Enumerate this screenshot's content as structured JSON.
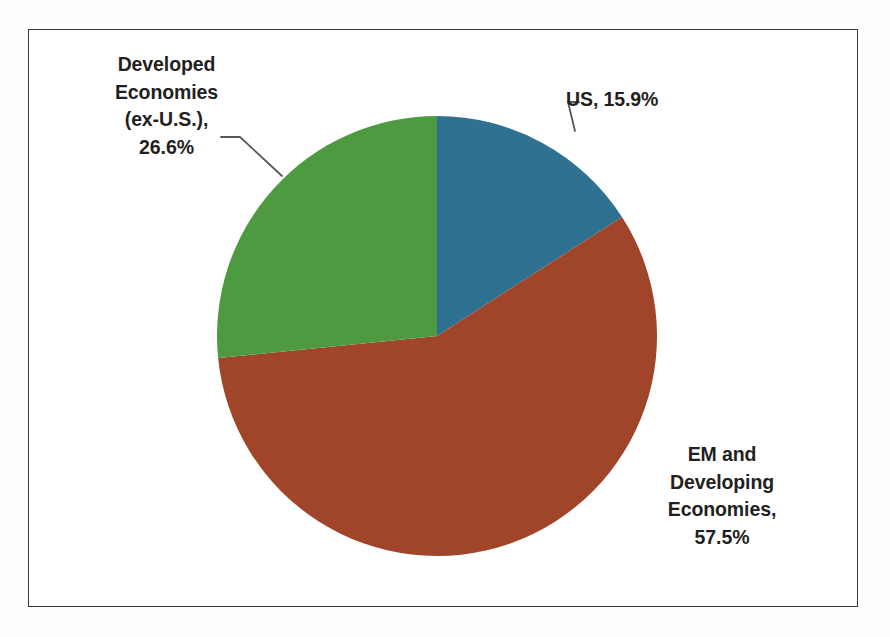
{
  "chart_data": {
    "type": "pie",
    "title": "",
    "subtitle": "",
    "xlabel": "",
    "ylabel": "",
    "legend_position": "none",
    "grid": false,
    "labels_inside": false,
    "start_angle_deg": 0,
    "direction": "clockwise",
    "categories": [
      "US",
      "EM and Developing Economies",
      "Developed Economies (ex-U.S.)"
    ],
    "values": [
      15.9,
      57.5,
      26.6
    ],
    "units": "percent",
    "total": 100.0,
    "colors": [
      "#2e7191",
      "#a0442a",
      "#4e9a41"
    ],
    "slices": [
      {
        "name": "US",
        "value": 15.9,
        "value_label": "15.9%",
        "color": "#2e7191",
        "start_angle_deg": 0.0,
        "end_angle_deg": 57.24,
        "label_text": "US, 15.9%",
        "leader_line": true
      },
      {
        "name": "EM and Developing Economies",
        "value": 57.5,
        "value_label": "57.5%",
        "color": "#a0442a",
        "start_angle_deg": 57.24,
        "end_angle_deg": 264.24,
        "label_text": "EM and Developing Economies, 57.5%",
        "leader_line": false
      },
      {
        "name": "Developed Economies (ex-U.S.)",
        "value": 26.6,
        "value_label": "26.6%",
        "color": "#4e9a41",
        "start_angle_deg": 264.24,
        "end_angle_deg": 360.0,
        "label_text": "Developed Economies (ex-U.S.), 26.6%",
        "leader_line": true
      }
    ]
  },
  "labels": {
    "developed": {
      "line1": "Developed",
      "line2": "Economies",
      "line3": "(ex-U.S.),",
      "line4": "26.6%"
    },
    "us": {
      "line1": "US, 15.9%"
    },
    "em": {
      "line1": "EM and",
      "line2": "Developing",
      "line3": "Economies,",
      "line4": "57.5%"
    }
  },
  "style": {
    "background_color": "#fefefe",
    "frame_color": "#3a3a3c",
    "text_color": "#231f20",
    "leader_line_color": "#58585b"
  }
}
